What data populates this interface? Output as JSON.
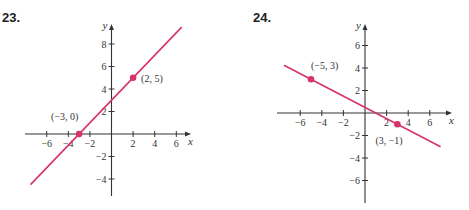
{
  "problems": [
    {
      "number": "23."
    },
    {
      "number": "24."
    }
  ],
  "chart_data": [
    {
      "type": "line",
      "title": "23.",
      "xlabel": "x",
      "ylabel": "y",
      "xticks": [
        -6,
        -4,
        -2,
        2,
        4,
        6
      ],
      "yticks": [
        -4,
        -2,
        2,
        4,
        6,
        8
      ],
      "xlim": [
        -7.5,
        7.5
      ],
      "ylim": [
        -5.5,
        9.5
      ],
      "line_color": "#d6336c",
      "points": [
        {
          "x": -3,
          "y": 0,
          "label": "(−3, 0)"
        },
        {
          "x": 2,
          "y": 5,
          "label": "(2, 5)"
        }
      ],
      "line": {
        "slope": 1,
        "intercept": 3
      }
    },
    {
      "type": "line",
      "title": "24.",
      "xlabel": "x",
      "ylabel": "y",
      "xticks": [
        -6,
        -4,
        -2,
        2,
        4,
        6
      ],
      "yticks": [
        -6,
        -4,
        -2,
        2,
        4,
        6
      ],
      "xlim": [
        -7.5,
        7.5
      ],
      "ylim": [
        -8,
        8
      ],
      "line_color": "#d6336c",
      "points": [
        {
          "x": -5,
          "y": 3,
          "label": "(−5, 3)"
        },
        {
          "x": 3,
          "y": -1,
          "label": "(3, −1)"
        }
      ],
      "line": {
        "slope": -0.5,
        "intercept": 0.5
      }
    }
  ]
}
